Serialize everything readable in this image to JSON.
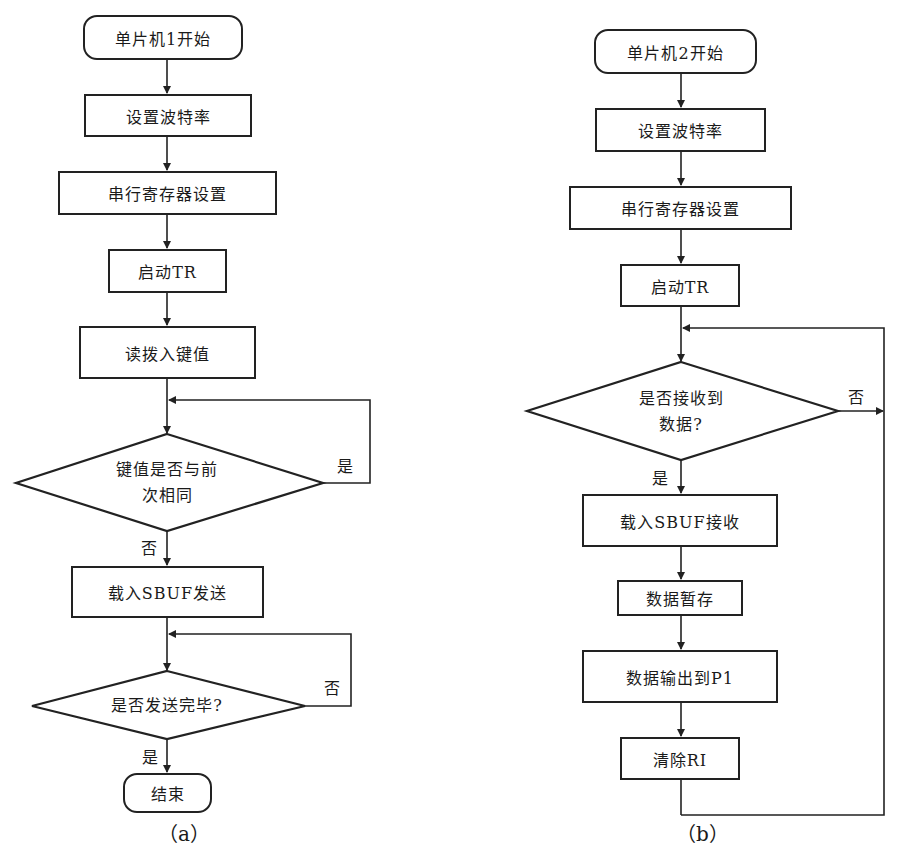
{
  "flowchart_a": {
    "caption": "（a）",
    "start": "单片机1开始",
    "set_baud": "设置波特率",
    "serial_reg": "串行寄存器设置",
    "start_tr": "启动TR",
    "read_key": "读拨入键值",
    "decision_same_line1": "键值是否与前",
    "decision_same_line2": "次相同",
    "decision_same_yes": "是",
    "decision_same_no": "否",
    "load_send": "载入SBUF发送",
    "decision_sent": "是否发送完毕?",
    "decision_sent_no": "否",
    "decision_sent_yes": "是",
    "end": "结束"
  },
  "flowchart_b": {
    "caption": "（b）",
    "start": "单片机2开始",
    "set_baud": "设置波特率",
    "serial_reg": "串行寄存器设置",
    "start_tr": "启动TR",
    "decision_recv_line1": "是否接收到",
    "decision_recv_line2": "数据?",
    "decision_recv_no": "否",
    "decision_recv_yes": "是",
    "load_recv": "载入SBUF接收",
    "data_store": "数据暂存",
    "data_output": "数据输出到P1",
    "clear_ri": "清除RI"
  }
}
